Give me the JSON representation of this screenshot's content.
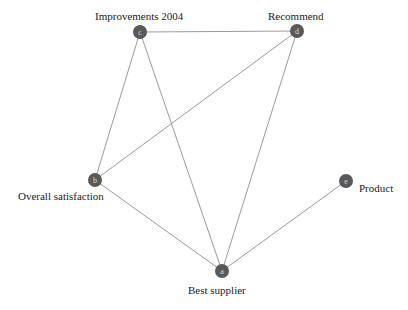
{
  "diagram": {
    "type": "node-link-network",
    "background_color": "#ffffff",
    "node_color": "#595959",
    "node_letter_color": "#d8d8d8",
    "edge_color": "#9b9b9b",
    "label_color": "#1b1b1b",
    "node_radius": 7,
    "nodes": [
      {
        "id": "a",
        "letter": "a",
        "label": "Best supplier",
        "x": 222,
        "y": 271,
        "label_position": "below"
      },
      {
        "id": "b",
        "letter": "b",
        "label": "Overall satisfaction",
        "x": 95,
        "y": 180,
        "label_position": "below-left"
      },
      {
        "id": "c",
        "letter": "c",
        "label": "Improvements 2004",
        "x": 140,
        "y": 32,
        "label_position": "above"
      },
      {
        "id": "d",
        "letter": "d",
        "label": "Recommend",
        "x": 297,
        "y": 31,
        "label_position": "above"
      },
      {
        "id": "e",
        "letter": "e",
        "label": "Product",
        "x": 346,
        "y": 181,
        "label_position": "right"
      }
    ],
    "edges": [
      {
        "source": "c",
        "target": "d"
      },
      {
        "source": "c",
        "target": "b"
      },
      {
        "source": "c",
        "target": "a"
      },
      {
        "source": "d",
        "target": "b"
      },
      {
        "source": "d",
        "target": "a"
      },
      {
        "source": "b",
        "target": "a"
      },
      {
        "source": "a",
        "target": "e"
      }
    ],
    "labels": {
      "improvements": "Improvements 2004",
      "recommend": "Recommend",
      "overall": "Overall satisfaction",
      "product": "Product",
      "best": "Best supplier"
    },
    "letters": {
      "a": "a",
      "b": "b",
      "c": "c",
      "d": "d",
      "e": "e"
    }
  }
}
